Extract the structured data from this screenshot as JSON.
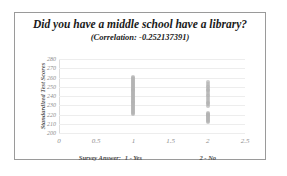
{
  "chart_data": {
    "type": "scatter",
    "title": "Did you have a middle school have a library?",
    "subtitle": "(Correlation: -0.252137391)",
    "xlabel": "",
    "ylabel": "Standardized Test Scores",
    "xlim": [
      0,
      2.5
    ],
    "ylim": [
      200,
      280
    ],
    "grid": true,
    "legend": "none",
    "xticks": [
      "0",
      "0.5",
      "1",
      "1.5",
      "2",
      "2.5"
    ],
    "xtick_values": [
      0,
      0.5,
      1,
      1.5,
      2,
      2.5
    ],
    "yticks": [
      "200",
      "210",
      "220",
      "230",
      "240",
      "250",
      "260",
      "270",
      "280"
    ],
    "ytick_values": [
      200,
      210,
      220,
      230,
      240,
      250,
      260,
      270,
      280
    ],
    "marker_color": "#b3b3b3",
    "series": [
      {
        "name": "1 - Yes",
        "x": 1,
        "values": [
          261,
          259,
          258,
          257,
          256,
          255,
          254,
          253,
          252,
          251,
          250,
          249,
          248,
          247,
          246,
          245,
          244,
          243,
          242,
          241,
          240,
          239,
          238,
          237,
          236,
          235,
          234,
          233,
          232,
          231,
          230,
          229,
          228,
          227,
          226,
          225,
          224,
          223,
          222,
          221
        ]
      },
      {
        "name": "2 - No",
        "x": 2,
        "values": [
          255,
          253,
          251,
          250,
          248,
          247,
          245,
          243,
          241,
          240,
          238,
          236,
          234,
          232,
          231,
          229,
          222,
          221,
          220,
          219,
          218,
          217,
          216,
          215,
          214,
          213,
          212
        ]
      }
    ],
    "category_labels": [
      {
        "label": "Survey Answer:",
        "x": 0.55
      },
      {
        "label": "1 - Yes",
        "x": 1.0
      },
      {
        "label": "2 - No",
        "x": 2.0
      }
    ]
  }
}
